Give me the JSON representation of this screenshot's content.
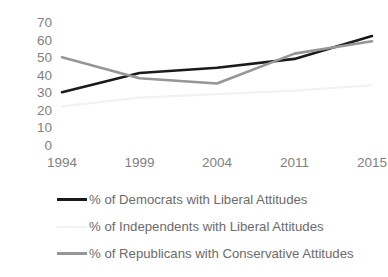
{
  "chart_data": {
    "type": "line",
    "title": "",
    "subtitle": "",
    "xlabel": "",
    "ylabel": "",
    "categories": [
      "1994",
      "1999",
      "2004",
      "2011",
      "2015"
    ],
    "ylim": [
      0,
      70
    ],
    "ytick_labels": [
      "70",
      "60",
      "50",
      "40",
      "30",
      "20",
      "10",
      "0"
    ],
    "ytick_values": [
      70,
      60,
      50,
      40,
      30,
      20,
      10,
      0
    ],
    "grid": false,
    "axis_lines": false,
    "legend_position": "bottom-left",
    "series": [
      {
        "name": "% of Democrats with Liberal Attitudes",
        "color": "#1a1a1a",
        "width": 2.6,
        "values": [
          30,
          41,
          44,
          49,
          62
        ]
      },
      {
        "name": "% of Independents with Liberal Attitudes",
        "color": "#f2f2f2",
        "width": 2.2,
        "values": [
          22,
          27,
          29,
          31,
          34
        ]
      },
      {
        "name": "% of Republicans with Conservative Attitudes",
        "color": "#969696",
        "width": 2.6,
        "values": [
          50,
          38,
          35,
          52,
          59
        ]
      }
    ]
  },
  "legend": {
    "items": [
      {
        "label": "% of Democrats with Liberal Attitudes",
        "color": "#1a1a1a"
      },
      {
        "label": "% of Independents with Liberal Attitudes",
        "color": "#f2f2f2"
      },
      {
        "label": "% of Republicans with Conservative Attitudes",
        "color": "#969696"
      }
    ]
  }
}
